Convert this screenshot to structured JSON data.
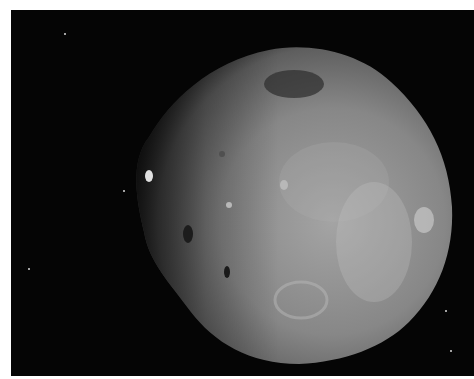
{
  "image": {
    "subject": "Irregular cratered moon (Phobos-like) against black space",
    "alt": "Grayscale photograph of a lumpy, cratered moon in space with a few faint stars",
    "background_color": "#050505",
    "border_color": "#ffffff",
    "surface_colors": [
      "#7a7a7a",
      "#8e8e8e",
      "#a8a8a8",
      "#3a3a3a"
    ]
  },
  "stars": [
    {
      "x": 64,
      "y": 33
    },
    {
      "x": 123,
      "y": 190
    },
    {
      "x": 28,
      "y": 268
    },
    {
      "x": 445,
      "y": 310
    },
    {
      "x": 450,
      "y": 350
    }
  ]
}
